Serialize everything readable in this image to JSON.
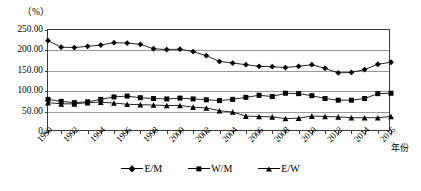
{
  "axes": {
    "unit_label": "（%）",
    "x_axis_title": "年份",
    "y_tick_labels": [
      "250.00",
      "200.00",
      "150.00",
      "100.00",
      "50.00",
      "0"
    ],
    "y_tick_values": [
      250,
      200,
      150,
      100,
      50,
      0
    ],
    "x_tick_labels": [
      "1990",
      "1992",
      "1994",
      "1996",
      "1998",
      "2000",
      "2002",
      "2004",
      "2006",
      "2008",
      "2010",
      "2012",
      "2014",
      "2016"
    ]
  },
  "legend": {
    "position": "bottom-center",
    "items": [
      {
        "label": "E/M",
        "marker": "diamond-marker"
      },
      {
        "label": "W/M",
        "marker": "square-marker"
      },
      {
        "label": "E/W",
        "marker": "triangle-marker"
      }
    ]
  },
  "chart_data": {
    "type": "line",
    "title": "",
    "subtitle": "",
    "xlabel": "年份",
    "ylabel": "（%）",
    "xlim": [
      1990,
      2016
    ],
    "ylim": [
      0,
      250
    ],
    "grid": true,
    "legend_position": "bottom-center",
    "x": [
      1990,
      1991,
      1992,
      1993,
      1994,
      1995,
      1996,
      1997,
      1998,
      1999,
      2000,
      2001,
      2002,
      2003,
      2004,
      2005,
      2006,
      2007,
      2008,
      2009,
      2010,
      2011,
      2012,
      2013,
      2014,
      2015,
      2016
    ],
    "categories": [
      "1990",
      "1991",
      "1992",
      "1993",
      "1994",
      "1995",
      "1996",
      "1997",
      "1998",
      "1999",
      "2000",
      "2001",
      "2002",
      "2003",
      "2004",
      "2005",
      "2006",
      "2007",
      "2008",
      "2009",
      "2010",
      "2011",
      "2012",
      "2013",
      "2014",
      "2015",
      "2016"
    ],
    "series": [
      {
        "name": "E/M",
        "marker": "diamond",
        "values": [
          224,
          208,
          207,
          210,
          213,
          219,
          218,
          215,
          204,
          202,
          203,
          197,
          187,
          173,
          169,
          165,
          161,
          160,
          158,
          161,
          165,
          156,
          145,
          146,
          153,
          166,
          171
        ]
      },
      {
        "name": "W/M",
        "marker": "square",
        "values": [
          80,
          75,
          72,
          74,
          80,
          86,
          88,
          84,
          82,
          81,
          83,
          81,
          79,
          77,
          80,
          85,
          90,
          87,
          95,
          94,
          89,
          82,
          78,
          78,
          82,
          94,
          95
        ]
      },
      {
        "name": "E/W",
        "marker": "triangle",
        "values": [
          72,
          69,
          69,
          72,
          73,
          71,
          68,
          67,
          66,
          65,
          65,
          61,
          59,
          52,
          49,
          39,
          38,
          37,
          33,
          34,
          39,
          38,
          37,
          35,
          35,
          35,
          38
        ]
      }
    ]
  }
}
